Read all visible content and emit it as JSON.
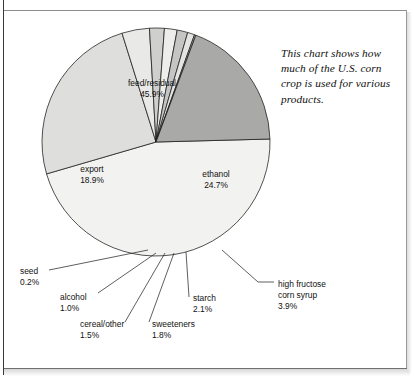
{
  "chart_data": {
    "type": "pie",
    "title": "",
    "subtitle": "",
    "annotation": "This chart shows how much of the U.S. corn crop is used for various products.",
    "unit": "%",
    "legend_position": "none",
    "grid": false,
    "start_angle_deg": -1.5,
    "direction": "clockwise",
    "categories": [
      "feed/residual",
      "ethanol",
      "high fructose corn syrup",
      "starch",
      "sweeteners",
      "cereal/other",
      "alcohol",
      "seed",
      "export"
    ],
    "values": [
      45.9,
      24.7,
      3.9,
      2.1,
      1.8,
      1.5,
      1.0,
      0.2,
      18.9
    ],
    "slices": [
      {
        "name": "feed/residual",
        "value": 45.9,
        "value_label": "45.9%",
        "color": "#f2f2f0",
        "label_mode": "inside",
        "label_x": 152,
        "label_y": 86
      },
      {
        "name": "ethanol",
        "value": 24.7,
        "value_label": "24.7%",
        "color": "#dededc",
        "label_mode": "inside",
        "label_x": 216,
        "label_y": 177
      },
      {
        "name": "high fructose corn syrup",
        "value": 3.9,
        "value_label": "3.9%",
        "color": "#e9e9e7",
        "label_mode": "callout",
        "label_lines": [
          "high fructose",
          "corn syrup"
        ],
        "label_x": 278,
        "label_y": 287,
        "leader": [
          [
            222,
            250
          ],
          [
            258,
            282
          ],
          [
            274,
            282
          ]
        ]
      },
      {
        "name": "starch",
        "value": 2.1,
        "value_label": "2.1%",
        "color": "#cfcfcd",
        "label_mode": "callout",
        "label_lines": [
          "starch"
        ],
        "label_x": 193,
        "label_y": 301,
        "leader": [
          [
            186,
            252
          ],
          [
            189,
            297
          ]
        ]
      },
      {
        "name": "sweeteners",
        "value": 1.8,
        "value_label": "1.8%",
        "color": "#ededeb",
        "label_mode": "callout",
        "label_lines": [
          "sweeteners"
        ],
        "label_x": 152,
        "label_y": 327,
        "leader": [
          [
            174,
            253
          ],
          [
            149,
            322
          ]
        ]
      },
      {
        "name": "cereal/other",
        "value": 1.5,
        "value_label": "1.5%",
        "color": "#c5c5c3",
        "label_mode": "callout",
        "label_lines": [
          "cereal/other"
        ],
        "label_x": 80,
        "label_y": 327,
        "leader": [
          [
            165,
            253
          ],
          [
            125,
            322
          ]
        ]
      },
      {
        "name": "alcohol",
        "value": 1.0,
        "value_label": "1.0%",
        "color": "#e4e4e2",
        "label_mode": "callout",
        "label_lines": [
          "alcohol"
        ],
        "label_x": 60,
        "label_y": 300,
        "leader": [
          [
            156,
            253
          ],
          [
            98,
            293
          ]
        ]
      },
      {
        "name": "seed",
        "value": 0.2,
        "value_label": "0.2%",
        "color": "#b8b8b6",
        "label_mode": "callout",
        "label_lines": [
          "seed"
        ],
        "label_x": 20,
        "label_y": 274,
        "leader": [
          [
            148,
            250
          ],
          [
            49,
            270
          ]
        ]
      },
      {
        "name": "export",
        "value": 18.9,
        "value_label": "18.9%",
        "color": "#a9a9a7",
        "label_mode": "inside",
        "label_x": 92,
        "label_y": 172
      }
    ],
    "geometry": {
      "cx": 156,
      "cy": 142,
      "r": 114
    }
  }
}
